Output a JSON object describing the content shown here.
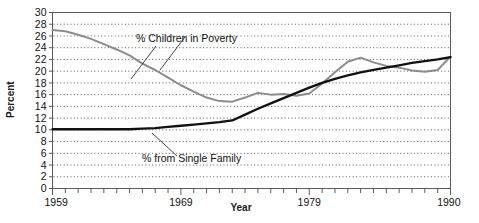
{
  "chart_data": {
    "type": "line",
    "title": "",
    "xlabel": "Year",
    "ylabel": "Percent",
    "xlim": [
      1959,
      1990
    ],
    "ylim": [
      0,
      30
    ],
    "ytick_step": 2,
    "grid": "horizontal-dotted",
    "legend_position": "inline-annotations",
    "yticks": [
      "30",
      "28",
      "26",
      "24",
      "22",
      "20",
      "18",
      "16",
      "14",
      "12",
      "10",
      "8",
      "6",
      "4",
      "2",
      "0"
    ],
    "xticks": [
      "1959",
      "1969",
      "1979",
      "1990"
    ],
    "xtick_values": [
      1959,
      1969,
      1979,
      1990
    ],
    "annotations": [
      {
        "id": "poverty-annotation",
        "text": "% Children in Poverty",
        "series": "% Children in Poverty"
      },
      {
        "id": "single-family-annotation",
        "text": "% from Single Family",
        "series": "% from Single Family"
      }
    ],
    "series": [
      {
        "name": "% Children in Poverty",
        "color": "#8c8c8c",
        "x": [
          1959,
          1960,
          1961,
          1962,
          1963,
          1964,
          1965,
          1966,
          1967,
          1968,
          1969,
          1970,
          1971,
          1972,
          1973,
          1974,
          1975,
          1976,
          1977,
          1978,
          1979,
          1980,
          1981,
          1982,
          1983,
          1984,
          1985,
          1986,
          1987,
          1988,
          1989,
          1990
        ],
        "values": [
          27.0,
          26.8,
          26.2,
          25.5,
          24.6,
          23.7,
          22.7,
          21.3,
          20.2,
          18.9,
          17.6,
          16.5,
          15.5,
          14.9,
          14.8,
          15.5,
          16.3,
          16.0,
          16.1,
          15.8,
          16.2,
          17.9,
          19.8,
          21.6,
          22.3,
          21.5,
          20.9,
          20.6,
          20.1,
          19.9,
          20.2,
          22.5
        ]
      },
      {
        "name": "% from Single Family",
        "color": "#111111",
        "x": [
          1959,
          1960,
          1961,
          1962,
          1963,
          1964,
          1965,
          1966,
          1967,
          1968,
          1969,
          1970,
          1971,
          1972,
          1973,
          1974,
          1975,
          1976,
          1977,
          1978,
          1979,
          1980,
          1981,
          1982,
          1983,
          1984,
          1985,
          1986,
          1987,
          1988,
          1989,
          1990
        ],
        "values": [
          10.1,
          10.1,
          10.1,
          10.1,
          10.1,
          10.1,
          10.1,
          10.2,
          10.3,
          10.5,
          10.7,
          10.9,
          11.1,
          11.3,
          11.6,
          12.6,
          13.6,
          14.5,
          15.4,
          16.3,
          17.2,
          18.0,
          18.7,
          19.3,
          19.8,
          20.2,
          20.6,
          21.0,
          21.4,
          21.7,
          22.0,
          22.4
        ]
      }
    ]
  },
  "axes": {
    "ylabel": "Percent",
    "xlabel": "Year"
  }
}
